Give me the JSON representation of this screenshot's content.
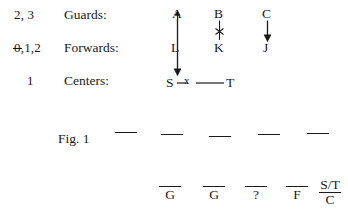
{
  "figure": {
    "caption": "Fig. 1",
    "rows": [
      {
        "count": "2, 3",
        "count_struck_prefix": "",
        "role": "Guards:",
        "players": [
          "A",
          "B",
          "C"
        ]
      },
      {
        "count": ",1,2",
        "count_struck_prefix": "0",
        "role": "Forwards:",
        "players": [
          "L",
          "K",
          "J"
        ]
      },
      {
        "count": "1",
        "count_struck_prefix": "",
        "role": "Centers:",
        "players": [
          "S",
          "T"
        ]
      }
    ],
    "center_link_mark": "x",
    "guard_forward_link_mark": "x",
    "answer_blanks": [
      {
        "glyph": "G",
        "is_fraction": false
      },
      {
        "glyph": "G",
        "is_fraction": false
      },
      {
        "glyph": "?",
        "is_fraction": false
      },
      {
        "glyph": "F",
        "is_fraction": false
      },
      {
        "glyph": "",
        "is_fraction": true,
        "numerator": "S/T",
        "denominator": "C"
      }
    ]
  }
}
